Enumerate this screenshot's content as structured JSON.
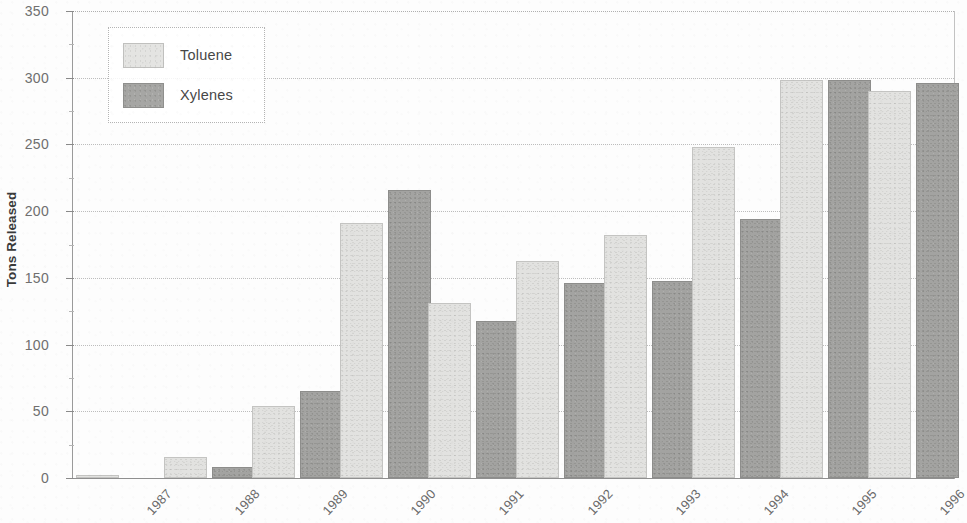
{
  "chart_data": {
    "type": "bar",
    "title": "",
    "subtitle": "",
    "xlabel": "",
    "ylabel": "Tons Released",
    "ylim": [
      0,
      350
    ],
    "ytick_labels": [
      "0",
      "50",
      "100",
      "150",
      "200",
      "250",
      "300",
      "350"
    ],
    "ytick_values": [
      0,
      50,
      100,
      150,
      200,
      250,
      300,
      350
    ],
    "yminor_interval": 25,
    "grid": true,
    "grid_style": "dotted",
    "legend_position": "upper-left",
    "categories": [
      "1987",
      "1988",
      "1989",
      "1990",
      "1991",
      "1992",
      "1993",
      "1994",
      "1995",
      "1996"
    ],
    "series": [
      {
        "name": "Toluene",
        "color": "#e2e2e0",
        "values": [
          2,
          16,
          54,
          191,
          131,
          163,
          182,
          248,
          298,
          290
        ]
      },
      {
        "name": "Xylenes",
        "color": "#a3a3a1",
        "values": [
          0,
          8,
          65,
          216,
          118,
          146,
          148,
          194,
          298,
          296
        ]
      }
    ]
  },
  "legend": {
    "entries": [
      {
        "label": "Toluene"
      },
      {
        "label": "Xylenes"
      }
    ]
  },
  "axes": {
    "y_title": "Tons Released"
  }
}
